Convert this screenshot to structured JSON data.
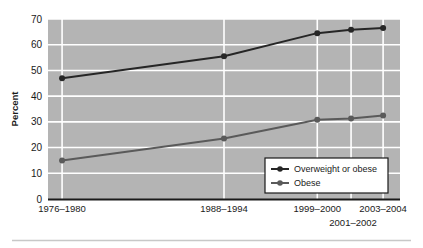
{
  "chart_data": {
    "type": "line",
    "title": "",
    "xlabel": "",
    "ylabel": "Percent",
    "ylim": [
      0,
      70
    ],
    "ytick_values": [
      0,
      10,
      20,
      30,
      40,
      50,
      60,
      70
    ],
    "ytick_labels": [
      "0",
      "10",
      "20",
      "30",
      "40",
      "50",
      "60",
      "70"
    ],
    "grid": true,
    "grid_color": "#ffffff",
    "plot_background": "#b4b4b4",
    "legend_position": "lower right",
    "categories": [
      "1976–1980",
      "1988–1994",
      "1999–2000",
      "2001–2002",
      "2003–2004"
    ],
    "xtick_labels_row1": [
      "1976–1980",
      "1988–1994",
      "1999–2000",
      "",
      "2003–2004"
    ],
    "xtick_label_offset": "2001–2002",
    "series": [
      {
        "name": "Overweight or obese",
        "color": "#262626",
        "marker": "circle",
        "values": [
          47.0,
          55.5,
          64.5,
          65.8,
          66.5
        ]
      },
      {
        "name": "Obese",
        "color": "#5a5a5a",
        "marker": "circle",
        "values": [
          15.0,
          23.5,
          30.8,
          31.3,
          32.5
        ]
      }
    ]
  },
  "legend": {
    "entries": [
      {
        "label": "Overweight or obese"
      },
      {
        "label": "Obese"
      }
    ]
  },
  "axis": {
    "y_title": "Percent"
  }
}
